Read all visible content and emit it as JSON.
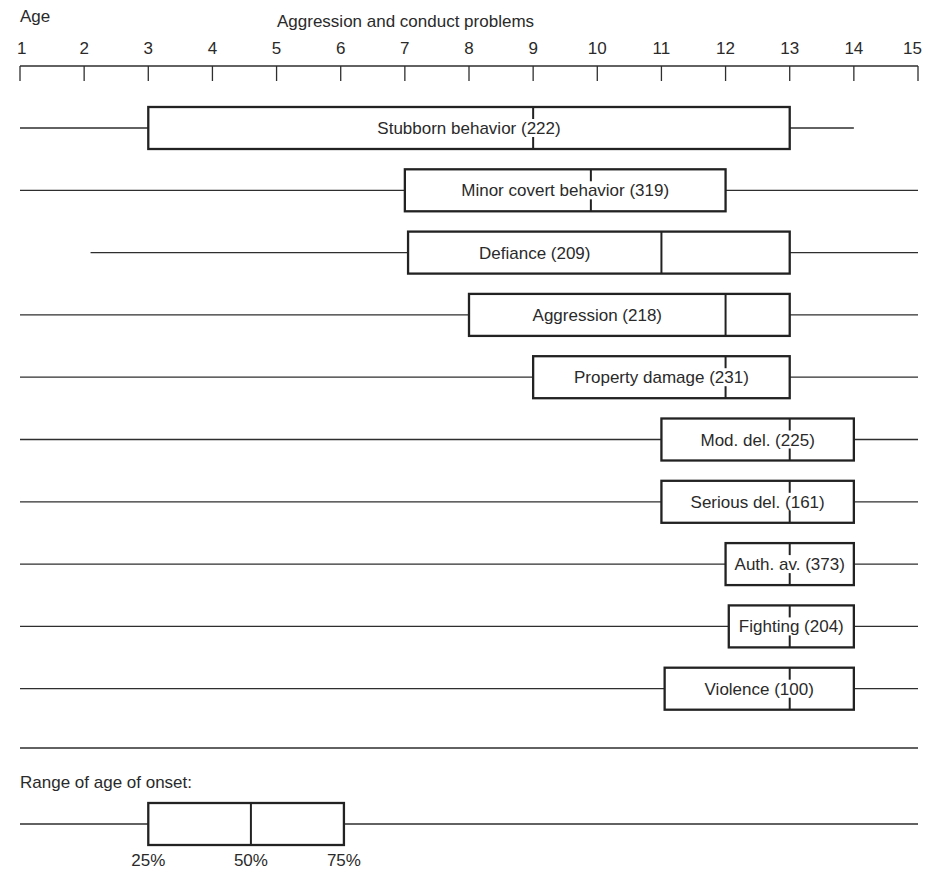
{
  "chart_data": {
    "type": "boxplot-timeline",
    "title": "Aggression and conduct problems",
    "xlabel": "Age",
    "xlim": [
      1,
      15
    ],
    "x_ticks": [
      1,
      2,
      3,
      4,
      5,
      6,
      7,
      8,
      9,
      10,
      11,
      12,
      13,
      14,
      15
    ],
    "x_tick_labels": [
      "1",
      "2",
      "3",
      "4",
      "5",
      "6",
      "7",
      "8",
      "9",
      "10",
      "11",
      "12",
      "13",
      "14",
      "15"
    ],
    "series": [
      {
        "name": "Stubborn behavior",
        "n": 222,
        "label": "Stubborn behavior (222)",
        "min": 1,
        "q1": 3,
        "median": 9,
        "q3": 13,
        "max": 14,
        "median_style": "dashed"
      },
      {
        "name": "Minor covert behavior",
        "n": 319,
        "label": "Minor covert behavior (319)",
        "min": 1,
        "q1": 7,
        "median": 9.9,
        "q3": 12,
        "max": 15,
        "median_style": "dashed"
      },
      {
        "name": "Defiance",
        "n": 209,
        "label": "Defiance (209)",
        "min": 2.1,
        "q1": 7.05,
        "median": 11,
        "q3": 13,
        "max": 15,
        "median_style": "solid"
      },
      {
        "name": "Aggression",
        "n": 218,
        "label": "Aggression (218)",
        "min": 1,
        "q1": 8,
        "median": 12,
        "q3": 13,
        "max": 15,
        "median_style": "solid"
      },
      {
        "name": "Property damage",
        "n": 231,
        "label": "Property damage (231)",
        "min": 1,
        "q1": 9,
        "median": 12,
        "q3": 13,
        "max": 15,
        "median_style": "dashed"
      },
      {
        "name": "Mod. del.",
        "n": 225,
        "label": "Mod. del. (225)",
        "min": 1,
        "q1": 11,
        "median": 13,
        "q3": 14,
        "max": 15,
        "median_style": "dashed"
      },
      {
        "name": "Serious del.",
        "n": 161,
        "label": "Serious del. (161)",
        "min": 1,
        "q1": 11,
        "median": 13,
        "q3": 14,
        "max": 15,
        "median_style": "dashed"
      },
      {
        "name": "Auth. av.",
        "n": 373,
        "label": "Auth. av. (373)",
        "min": 1,
        "q1": 12,
        "median": 13,
        "q3": 14,
        "max": 15,
        "median_style": "dashed"
      },
      {
        "name": "Fighting",
        "n": 204,
        "label": "Fighting (204)",
        "min": 1,
        "q1": 12.05,
        "median": 13,
        "q3": 14,
        "max": 15,
        "median_style": "dashed"
      },
      {
        "name": "Violence",
        "n": 100,
        "label": "Violence (100)",
        "min": 1,
        "q1": 11.05,
        "median": 13,
        "q3": 14,
        "max": 15,
        "median_style": "dashed"
      }
    ],
    "legend": {
      "title": "Range of age of onset:",
      "placement": "bottom-left",
      "example": {
        "min": 1,
        "q1": 3,
        "median": 4.6,
        "q3": 6.05,
        "max": 15
      },
      "labels": [
        "25%",
        "50%",
        "75%"
      ]
    },
    "grid": false
  }
}
